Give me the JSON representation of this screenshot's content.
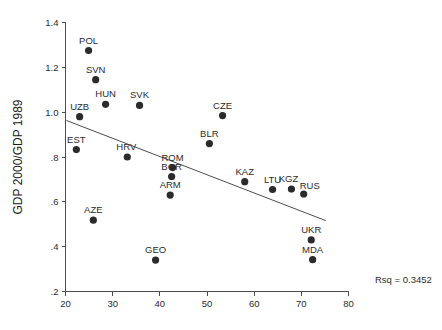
{
  "chart_data": {
    "type": "scatter",
    "title": "",
    "xlabel": "",
    "ylabel": "GDP 2000/GDP 1989",
    "xlim": [
      20,
      80
    ],
    "ylim": [
      0.2,
      1.4
    ],
    "xticks": [
      20,
      30,
      40,
      50,
      60,
      70,
      80
    ],
    "xtick_labels": [
      "20",
      "30",
      "40",
      "50",
      "60",
      "70",
      "80"
    ],
    "yticks": [
      0.2,
      0.4,
      0.6,
      0.8,
      1.0,
      1.2,
      1.4
    ],
    "ytick_labels": [
      ".2",
      ".4",
      ".6",
      ".8",
      "1.0",
      "1.2",
      "1.4"
    ],
    "grid": false,
    "legend": "none",
    "points": [
      {
        "label": "POL",
        "x": 24.9,
        "y": 1.275
      },
      {
        "label": "SVN",
        "x": 26.4,
        "y": 1.145
      },
      {
        "label": "HUN",
        "x": 28.5,
        "y": 1.035
      },
      {
        "label": "SVK",
        "x": 35.7,
        "y": 1.03
      },
      {
        "label": "UZB",
        "x": 23.0,
        "y": 0.98
      },
      {
        "label": "CZE",
        "x": 53.3,
        "y": 0.985
      },
      {
        "label": "BLR",
        "x": 50.5,
        "y": 0.86
      },
      {
        "label": "EST",
        "x": 22.3,
        "y": 0.833
      },
      {
        "label": "HRV",
        "x": 33.1,
        "y": 0.8
      },
      {
        "label": "ROM",
        "x": 42.7,
        "y": 0.753
      },
      {
        "label": "BGR",
        "x": 42.5,
        "y": 0.713
      },
      {
        "label": "ARM",
        "x": 42.2,
        "y": 0.63
      },
      {
        "label": "KAZ",
        "x": 58.0,
        "y": 0.69
      },
      {
        "label": "LTU",
        "x": 63.9,
        "y": 0.655
      },
      {
        "label": "KGZ",
        "x": 67.9,
        "y": 0.657
      },
      {
        "label": "RUS",
        "x": 70.5,
        "y": 0.635
      },
      {
        "label": "AZE",
        "x": 25.9,
        "y": 0.518
      },
      {
        "label": "GEO",
        "x": 39.1,
        "y": 0.34
      },
      {
        "label": "UKR",
        "x": 72.1,
        "y": 0.43
      },
      {
        "label": "MDA",
        "x": 72.4,
        "y": 0.342
      }
    ],
    "fit_line": {
      "x_start": 20.2,
      "y_start": 0.963,
      "x_end": 75.2,
      "y_end": 0.516
    },
    "annotations": [
      {
        "name": "rsq",
        "text": "Rsq = 0.3452"
      }
    ]
  },
  "colors": {
    "point": "#2b2b2b",
    "axis": "#4d4d4d",
    "text": "#1a1a1a",
    "background": "#ffffff"
  }
}
